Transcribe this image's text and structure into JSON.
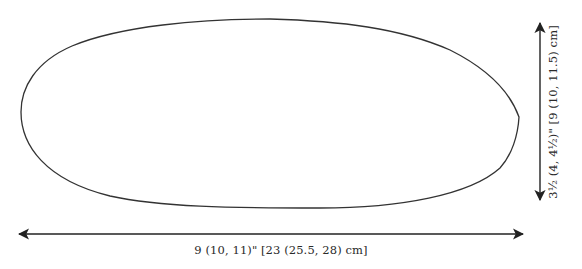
{
  "diagram": {
    "shape": {
      "name": "sole-outline",
      "stroke_color": "#333333",
      "fill_color": "#ffffff"
    },
    "width_dimension": {
      "label": "9 (10, 11)\" [23 (25.5, 28) cm]",
      "arrow_color": "#222222"
    },
    "height_dimension": {
      "label": "3½ (4, 4½)\" [9 (10, 11.5) cm]",
      "arrow_color": "#222222"
    }
  }
}
